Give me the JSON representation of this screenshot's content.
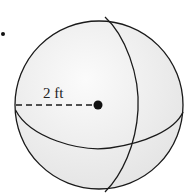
{
  "figure": {
    "radius_label": "2 ft",
    "colors": {
      "background": "#ffffff",
      "sphere_fill": "#ececec",
      "highlight": "#fafafa",
      "stroke": "#1a1a1a"
    }
  }
}
